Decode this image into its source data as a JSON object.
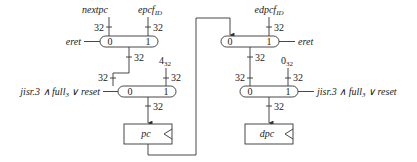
{
  "diagram": {
    "left": {
      "mux1": {
        "inputs": [
          "nextpc",
          "epcf_ID"
        ],
        "input0_label": "nextpc",
        "input1_label_main": "epcf",
        "input1_label_sub": "ID",
        "port0": "0",
        "port1": "1",
        "select": "eret",
        "width_in0": "32",
        "width_in1": "32",
        "width_out": "32"
      },
      "mux2": {
        "const_main": "4",
        "const_sub": "32",
        "port0": "0",
        "port1": "1",
        "select_main": "jisr.3 ∧ full",
        "select_sub": "3",
        "select_tail": " ∨ reset",
        "width_in0": "32",
        "width_in1": "32",
        "width_out": "32"
      },
      "register": {
        "label": "pc"
      }
    },
    "right": {
      "mux1": {
        "input1_label_main": "edpcf",
        "input1_label_sub": "ID",
        "port0": "0",
        "port1": "1",
        "select": "eret",
        "width_in1": "32",
        "width_out": "32"
      },
      "mux2": {
        "const_main": "0",
        "const_sub": "32",
        "port0": "0",
        "port1": "1",
        "select_main": "jisr.3 ∧ full",
        "select_sub": "3",
        "select_tail": " ∨ reset",
        "width_in0": "32",
        "width_in1": "32",
        "width_out": "32"
      },
      "register": {
        "label": "dpc"
      }
    }
  }
}
